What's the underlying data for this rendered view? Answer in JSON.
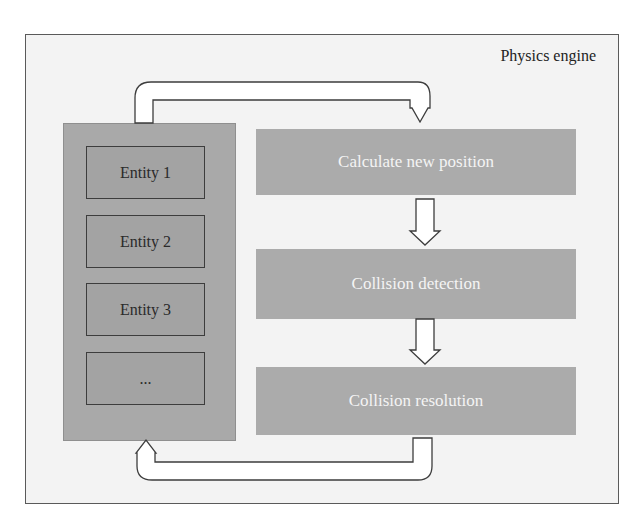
{
  "diagram": {
    "title": "Physics engine",
    "entities": [
      {
        "label": "Entity 1"
      },
      {
        "label": "Entity 2"
      },
      {
        "label": "Entity 3"
      },
      {
        "label": "..."
      }
    ],
    "steps": [
      {
        "label": "Calculate new position"
      },
      {
        "label": "Collision detection"
      },
      {
        "label": "Collision resolution"
      }
    ],
    "colors": {
      "panel": "#a9a9a9",
      "step_box": "#ababab",
      "frame_bg": "#f3f3f3",
      "arrow_fill": "#ffffff",
      "outline": "#3d3d3d"
    },
    "flows": [
      {
        "from": "entities",
        "to": "Calculate new position"
      },
      {
        "from": "Calculate new position",
        "to": "Collision detection"
      },
      {
        "from": "Collision detection",
        "to": "Collision resolution"
      },
      {
        "from": "Collision resolution",
        "to": "entities"
      }
    ]
  }
}
